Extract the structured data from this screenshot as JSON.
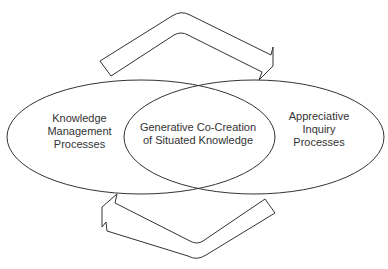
{
  "diagram": {
    "type": "venn-cycle",
    "stroke_color": "#333333",
    "background_color": "#ffffff",
    "left_circle": {
      "lines": [
        "Knowledge",
        "Management",
        "Processes"
      ]
    },
    "intersection": {
      "lines": [
        "Generative Co-Creation",
        "of Situated Knowledge"
      ]
    },
    "right_circle": {
      "lines": [
        "Appreciative",
        "Inquiry",
        "Processes"
      ]
    },
    "arrows": [
      {
        "id": "top-arrow",
        "direction": "left-to-right",
        "position": "above"
      },
      {
        "id": "bottom-arrow",
        "direction": "right-to-left",
        "position": "below"
      }
    ]
  }
}
